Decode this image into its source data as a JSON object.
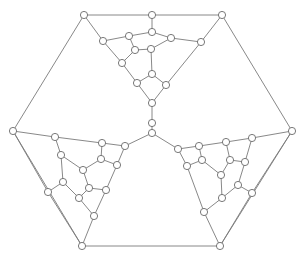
{
  "diagram": {
    "type": "planar-graph",
    "width": 306,
    "height": 256,
    "node_radius": 3.6,
    "colors": {
      "edge": "#7a7a7a",
      "node_stroke": "#6a6a6a",
      "node_fill": "#ffffff",
      "background": "#ffffff"
    },
    "nodes": [
      {
        "id": "hex_tl",
        "x": 84,
        "y": 15
      },
      {
        "id": "hex_tm",
        "x": 152,
        "y": 15
      },
      {
        "id": "hex_tr",
        "x": 222,
        "y": 15
      },
      {
        "id": "hex_r",
        "x": 292,
        "y": 131
      },
      {
        "id": "hex_br",
        "x": 220,
        "y": 246
      },
      {
        "id": "hex_bl",
        "x": 82,
        "y": 246
      },
      {
        "id": "hex_l",
        "x": 13,
        "y": 131
      },
      {
        "id": "center",
        "x": 152,
        "y": 133
      },
      {
        "id": "t1",
        "x": 103,
        "y": 41
      },
      {
        "id": "t2",
        "x": 129,
        "y": 36
      },
      {
        "id": "t3",
        "x": 152,
        "y": 32
      },
      {
        "id": "t4",
        "x": 171,
        "y": 38
      },
      {
        "id": "t5",
        "x": 201,
        "y": 42
      },
      {
        "id": "t6",
        "x": 135,
        "y": 50
      },
      {
        "id": "t7",
        "x": 151,
        "y": 49
      },
      {
        "id": "t8",
        "x": 122,
        "y": 63
      },
      {
        "id": "t9",
        "x": 152,
        "y": 74
      },
      {
        "id": "t10",
        "x": 137,
        "y": 83
      },
      {
        "id": "t11",
        "x": 166,
        "y": 85
      },
      {
        "id": "t12",
        "x": 152,
        "y": 103
      },
      {
        "id": "t13",
        "x": 152,
        "y": 123
      },
      {
        "id": "l1",
        "x": 55,
        "y": 137
      },
      {
        "id": "l2",
        "x": 102,
        "y": 143
      },
      {
        "id": "l3",
        "x": 125,
        "y": 146
      },
      {
        "id": "l4",
        "x": 61,
        "y": 155
      },
      {
        "id": "l5",
        "x": 101,
        "y": 159
      },
      {
        "id": "l6",
        "x": 117,
        "y": 165
      },
      {
        "id": "l7",
        "x": 83,
        "y": 170
      },
      {
        "id": "l8",
        "x": 63,
        "y": 182
      },
      {
        "id": "l9",
        "x": 89,
        "y": 188
      },
      {
        "id": "l10",
        "x": 106,
        "y": 190
      },
      {
        "id": "l11",
        "x": 48,
        "y": 192
      },
      {
        "id": "l12",
        "x": 79,
        "y": 198
      },
      {
        "id": "l13",
        "x": 94,
        "y": 216
      },
      {
        "id": "r1",
        "x": 178,
        "y": 149
      },
      {
        "id": "r2",
        "x": 199,
        "y": 146
      },
      {
        "id": "r3",
        "x": 226,
        "y": 142
      },
      {
        "id": "r4",
        "x": 252,
        "y": 138
      },
      {
        "id": "r5",
        "x": 187,
        "y": 166
      },
      {
        "id": "r6",
        "x": 202,
        "y": 160
      },
      {
        "id": "r7",
        "x": 230,
        "y": 160
      },
      {
        "id": "r8",
        "x": 245,
        "y": 162
      },
      {
        "id": "r9",
        "x": 221,
        "y": 175
      },
      {
        "id": "r10",
        "x": 238,
        "y": 185
      },
      {
        "id": "r11",
        "x": 252,
        "y": 193
      },
      {
        "id": "r12",
        "x": 222,
        "y": 198
      },
      {
        "id": "r13",
        "x": 204,
        "y": 212
      }
    ],
    "edges": [
      [
        "hex_tl",
        "hex_tm"
      ],
      [
        "hex_tm",
        "hex_tr"
      ],
      [
        "hex_tr",
        "hex_r"
      ],
      [
        "hex_r",
        "hex_br"
      ],
      [
        "hex_br",
        "hex_bl"
      ],
      [
        "hex_bl",
        "hex_l"
      ],
      [
        "hex_l",
        "hex_tl"
      ],
      [
        "hex_tm",
        "t3"
      ],
      [
        "hex_tl",
        "t1"
      ],
      [
        "hex_tr",
        "t5"
      ],
      [
        "t1",
        "t2"
      ],
      [
        "t2",
        "t3"
      ],
      [
        "t3",
        "t4"
      ],
      [
        "t4",
        "t5"
      ],
      [
        "t2",
        "t6"
      ],
      [
        "t6",
        "t7"
      ],
      [
        "t4",
        "t7"
      ],
      [
        "t6",
        "t8"
      ],
      [
        "t1",
        "t8"
      ],
      [
        "t7",
        "t9"
      ],
      [
        "t8",
        "t10"
      ],
      [
        "t9",
        "t10"
      ],
      [
        "t9",
        "t11"
      ],
      [
        "t5",
        "t11"
      ],
      [
        "t10",
        "t12"
      ],
      [
        "t11",
        "t12"
      ],
      [
        "t12",
        "t13"
      ],
      [
        "t13",
        "center"
      ],
      [
        "hex_l",
        "l1"
      ],
      [
        "hex_bl",
        "l13"
      ],
      [
        "hex_l",
        "l11"
      ],
      [
        "l1",
        "l2"
      ],
      [
        "l2",
        "l3"
      ],
      [
        "l3",
        "center"
      ],
      [
        "l1",
        "l4"
      ],
      [
        "l2",
        "l5"
      ],
      [
        "l3",
        "l6"
      ],
      [
        "l5",
        "l6"
      ],
      [
        "l4",
        "l7"
      ],
      [
        "l5",
        "l7"
      ],
      [
        "l4",
        "l8"
      ],
      [
        "l7",
        "l9"
      ],
      [
        "l6",
        "l10"
      ],
      [
        "l9",
        "l10"
      ],
      [
        "l8",
        "l11"
      ],
      [
        "l8",
        "l12"
      ],
      [
        "l9",
        "l12"
      ],
      [
        "l12",
        "l13"
      ],
      [
        "l10",
        "l13"
      ],
      [
        "l11",
        "hex_bl"
      ],
      [
        "hex_r",
        "r4"
      ],
      [
        "hex_br",
        "r13"
      ],
      [
        "hex_r",
        "r11"
      ],
      [
        "center",
        "r1"
      ],
      [
        "r1",
        "r2"
      ],
      [
        "r2",
        "r3"
      ],
      [
        "r3",
        "r4"
      ],
      [
        "r1",
        "r5"
      ],
      [
        "r2",
        "r6"
      ],
      [
        "r5",
        "r6"
      ],
      [
        "r3",
        "r7"
      ],
      [
        "r4",
        "r8"
      ],
      [
        "r7",
        "r8"
      ],
      [
        "r6",
        "r9"
      ],
      [
        "r7",
        "r9"
      ],
      [
        "r8",
        "r10"
      ],
      [
        "r9",
        "r12"
      ],
      [
        "r10",
        "r12"
      ],
      [
        "r10",
        "r11"
      ],
      [
        "r5",
        "r13"
      ],
      [
        "r12",
        "r13"
      ],
      [
        "r11",
        "hex_br"
      ]
    ]
  }
}
